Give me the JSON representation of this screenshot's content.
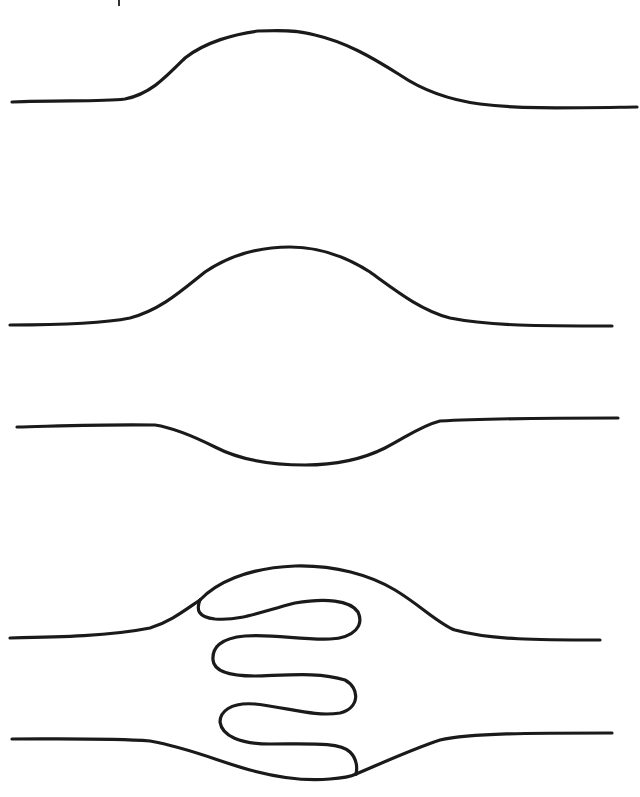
{
  "diagram": {
    "background": "#ffffff",
    "stroke_color": "#1a1a1a",
    "panels": [
      {
        "id": "curve-1",
        "shape": "upward bump (gentle wave crest)"
      },
      {
        "id": "curve-2",
        "shape": "upward bump (symmetric hill)"
      },
      {
        "id": "curve-3",
        "shape": "downward dip (shallow trough)"
      },
      {
        "id": "curve-4",
        "shape": "two lines bulging apart with a serpentine folded loop between them"
      }
    ]
  }
}
